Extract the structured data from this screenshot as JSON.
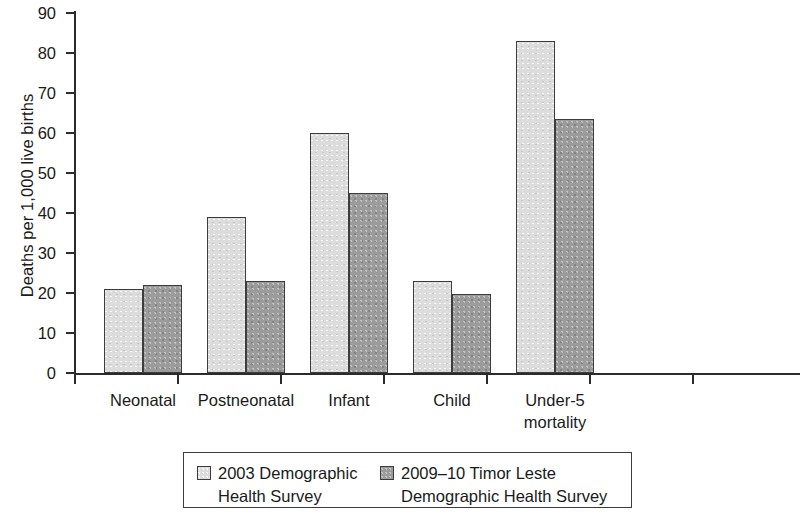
{
  "chart_data": {
    "type": "bar",
    "title": "",
    "xlabel": "",
    "ylabel": "Deaths per 1,000 live births",
    "ylim": [
      0,
      90
    ],
    "ytick_step": 10,
    "yticks": [
      "0",
      "10",
      "20",
      "30",
      "40",
      "50",
      "60",
      "70",
      "80",
      "90"
    ],
    "grid": false,
    "legend_position": "bottom",
    "categories": [
      "Neonatal",
      "Postneonatal",
      "Infant",
      "Child",
      "Under-5 mortality"
    ],
    "category_labels": [
      [
        "Neonatal"
      ],
      [
        "Postneonatal"
      ],
      [
        "Infant"
      ],
      [
        "Child"
      ],
      [
        "Under-5",
        "mortality"
      ]
    ],
    "series": [
      {
        "name": "2003 Demographic Health Survey",
        "color": "#dcdcdc",
        "values": [
          21,
          39,
          60,
          23,
          83
        ]
      },
      {
        "name": "2009–10 Timor Leste Demographic Health Survey",
        "color": "#9b9b9b",
        "values": [
          22,
          23,
          45,
          19.7,
          63.5
        ]
      }
    ]
  },
  "legend": {
    "entries": [
      {
        "label": "2003 Demographic\nHealth Survey",
        "swatch": "light-gray-swatch"
      },
      {
        "label": "2009–10 Timor Leste\nDemographic Health Survey",
        "swatch": "dark-gray-swatch"
      }
    ]
  },
  "axes": {
    "y_title": "Deaths per 1,000 live births"
  }
}
